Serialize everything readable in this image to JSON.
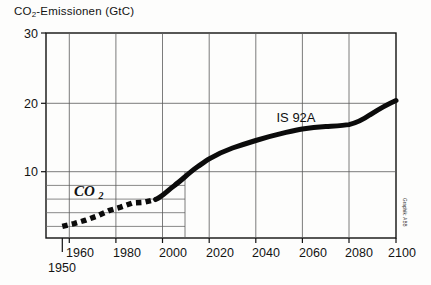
{
  "chart_data": {
    "type": "line",
    "title": "CO2-Emissionen (GtC)",
    "title_main": "CO",
    "title_sub": "2",
    "title_rest": "-Emissionen (GtC)",
    "xlabel": "",
    "ylabel": "CO2-Emissionen (GtC)",
    "xlim": [
      1950,
      2100
    ],
    "ylim": [
      0,
      30
    ],
    "grid": true,
    "legend_position": "inline-annotation",
    "y_ticks": [
      10,
      20,
      30
    ],
    "y_tick_labels": [
      "10",
      "20",
      "30"
    ],
    "y_minor_gridlines": [
      2,
      4,
      6,
      8
    ],
    "x_ticks": [
      1950,
      1960,
      1980,
      2000,
      2020,
      2040,
      2060,
      2080,
      2100
    ],
    "x_tick_labels": [
      "1950",
      "1960",
      "1980",
      "2000",
      "2020",
      "2040",
      "2060",
      "2080",
      "2100"
    ],
    "annotations": [
      {
        "text": "CO2",
        "x": 1968,
        "y": 6.2,
        "style": "italic"
      },
      {
        "text": "IS 92A",
        "x": 2055,
        "y": 16.4,
        "style": "plain"
      }
    ],
    "credit": "Graphik: ABB",
    "series": [
      {
        "name": "CO2",
        "style": "dotted",
        "x": [
          1950,
          1955,
          1960,
          1965,
          1970,
          1975,
          1980,
          1985,
          1990
        ],
        "values": [
          1.7,
          2.1,
          2.6,
          3.2,
          4.0,
          4.5,
          5.1,
          5.2,
          5.6
        ]
      },
      {
        "name": "IS 92A",
        "style": "solid",
        "x": [
          1990,
          2000,
          2010,
          2020,
          2030,
          2040,
          2050,
          2060,
          2070,
          2080,
          2090,
          2100
        ],
        "values": [
          5.6,
          7.6,
          9.8,
          11.8,
          12.8,
          13.6,
          14.3,
          14.9,
          15.1,
          15.4,
          17.2,
          19.2
        ]
      }
    ]
  },
  "figure": {
    "background_color": "#fdfdfc",
    "axis_color": "#111111",
    "grid_color": "#5a5a5a",
    "curve_color": "#0b0b0b"
  }
}
